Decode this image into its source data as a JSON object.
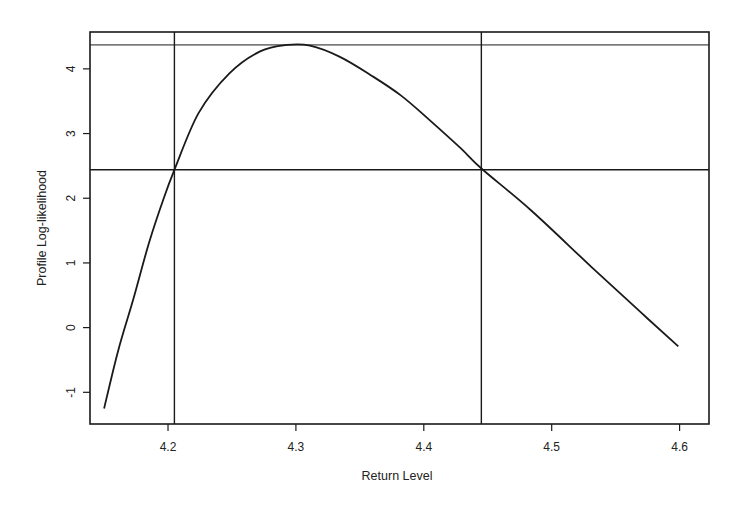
{
  "chart_data": {
    "type": "line",
    "title": "",
    "xlabel": "Return Level",
    "ylabel": "Profile Log-likelihood",
    "xlim": [
      4.139,
      4.623
    ],
    "ylim": [
      -1.49,
      4.57
    ],
    "grid": false,
    "legend": null,
    "x_ticks": [
      4.2,
      4.3,
      4.4,
      4.5,
      4.6
    ],
    "x_tick_labels": [
      "4.2",
      "4.3",
      "4.4",
      "4.5",
      "4.6"
    ],
    "y_ticks": [
      -1,
      0,
      1,
      2,
      3,
      4
    ],
    "y_tick_labels": [
      "-1",
      "0",
      "1",
      "2",
      "3",
      "4"
    ],
    "series": [
      {
        "name": "profile-log-likelihood",
        "x": [
          4.15,
          4.161,
          4.173,
          4.185,
          4.197,
          4.205,
          4.224,
          4.248,
          4.272,
          4.293,
          4.311,
          4.334,
          4.358,
          4.382,
          4.405,
          4.429,
          4.445,
          4.484,
          4.531,
          4.57,
          4.599
        ],
        "y": [
          -1.25,
          -0.36,
          0.45,
          1.3,
          2.02,
          2.44,
          3.32,
          3.93,
          4.27,
          4.37,
          4.36,
          4.19,
          3.91,
          3.59,
          3.2,
          2.77,
          2.46,
          1.81,
          0.94,
          0.23,
          -0.29
        ]
      }
    ],
    "reference_lines": {
      "horizontal": [
        {
          "name": "max-log-likelihood",
          "y": 4.37
        },
        {
          "name": "confidence-threshold",
          "y": 2.44
        }
      ],
      "vertical": [
        {
          "name": "lower-ci-bound",
          "x": 4.205
        },
        {
          "name": "upper-ci-bound",
          "x": 4.445
        }
      ]
    },
    "colors": {
      "line": "#1a1a1a",
      "frame": "#1a1a1a",
      "background": "#ffffff"
    }
  },
  "labels": {
    "xlabel": "Return Level",
    "ylabel": "Profile Log-likelihood"
  }
}
